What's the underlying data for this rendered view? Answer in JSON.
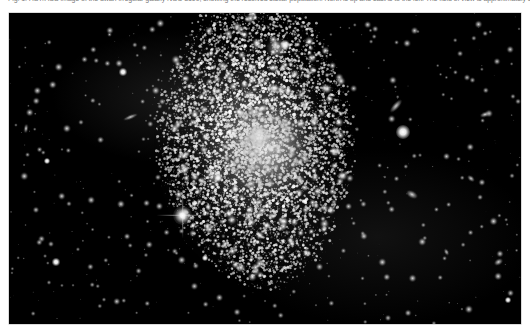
{
  "figure": {
    "caption": "Fig. 1. HST/ACS image of the dwarf irregular galaxy NGC 3109, showing the resolved stellar population. North is up and east is to the left. The field of view is approximately 3.4 x 2.0 arcmin.",
    "caption_state": "clipped-at-top-edge",
    "image_alt": "Astronomical photograph of a resolved dwarf irregular galaxy on a black sky background",
    "background_color": "#ffffff",
    "sky_color": "#000000",
    "star_color": "#ffffff",
    "border_color": "#b8b8b8"
  },
  "photo": {
    "x": 9,
    "y": 13,
    "width": 512,
    "height": 311
  },
  "objects": {
    "galaxy": {
      "name": "dwarf-irregular-galaxy",
      "center_x": 255,
      "center_y": 140,
      "extent_x": [
        150,
        345
      ],
      "extent_y": [
        20,
        290
      ],
      "description": "diffuse elongated blob resolved into thousands of individual stars, brightest toward the centre"
    },
    "bright_star": {
      "name": "foreground-star-with-diffraction-spikes",
      "x": 182,
      "y": 215,
      "spike_count": 4
    },
    "background_galaxies": [
      {
        "x": 130,
        "y": 117,
        "w": 15,
        "h": 4,
        "angle": -22
      },
      {
        "x": 26,
        "y": 128,
        "w": 4,
        "h": 9,
        "angle": 8
      },
      {
        "x": 396,
        "y": 106,
        "w": 16,
        "h": 6,
        "angle": -48
      },
      {
        "x": 485,
        "y": 114,
        "w": 10,
        "h": 5,
        "angle": -18
      },
      {
        "x": 412,
        "y": 194,
        "w": 12,
        "h": 7,
        "angle": 28
      },
      {
        "x": 471,
        "y": 178,
        "w": 8,
        "h": 5,
        "angle": 40
      },
      {
        "x": 498,
        "y": 262,
        "w": 9,
        "h": 6,
        "angle": -30
      },
      {
        "x": 446,
        "y": 252,
        "w": 7,
        "h": 4,
        "angle": 62
      }
    ],
    "bright_points": [
      {
        "x": 403,
        "y": 132,
        "r": 4.6
      },
      {
        "x": 285,
        "y": 45,
        "r": 3.4
      },
      {
        "x": 123,
        "y": 72,
        "r": 2.2
      },
      {
        "x": 47,
        "y": 161,
        "r": 2.0
      },
      {
        "x": 218,
        "y": 178,
        "r": 2.6
      },
      {
        "x": 205,
        "y": 258,
        "r": 2.0
      },
      {
        "x": 56,
        "y": 262,
        "r": 2.2
      },
      {
        "x": 508,
        "y": 300,
        "r": 1.8
      }
    ]
  }
}
